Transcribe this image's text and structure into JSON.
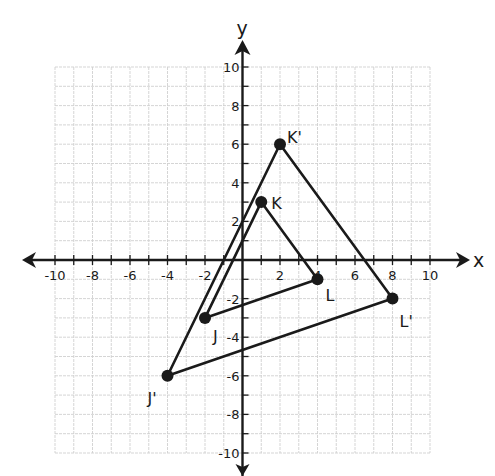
{
  "diagram": {
    "type": "coordinate-plane-dilation",
    "axes": {
      "x_label": "x",
      "y_label": "y",
      "range": {
        "xmin": -10,
        "xmax": 10,
        "ymin": -10,
        "ymax": 10
      },
      "grid": true,
      "grid_step": 1,
      "label_step": 2,
      "x_tick_labels": [
        "-10",
        "-8",
        "-6",
        "-4",
        "-2",
        "2",
        "4",
        "6",
        "8",
        "10"
      ],
      "y_tick_labels": [
        "10",
        "8",
        "6",
        "4",
        "2",
        "-2",
        "-4",
        "-6",
        "-8",
        "-10"
      ]
    },
    "figures": [
      {
        "name": "triangle-JKL",
        "vertices": [
          {
            "label": "J",
            "x": -2,
            "y": -3
          },
          {
            "label": "K",
            "x": 1,
            "y": 3
          },
          {
            "label": "L",
            "x": 4,
            "y": -1
          }
        ]
      },
      {
        "name": "triangle-J'K'L'",
        "vertices": [
          {
            "label": "J'",
            "x": -4,
            "y": -6
          },
          {
            "label": "K'",
            "x": 2,
            "y": 6
          },
          {
            "label": "L'",
            "x": 8,
            "y": -2
          }
        ]
      }
    ],
    "colors": {
      "grid": "#d0d0d0",
      "axis": "#1a1a1a",
      "figure": "#1a1a1a",
      "background": "#ffffff"
    }
  }
}
